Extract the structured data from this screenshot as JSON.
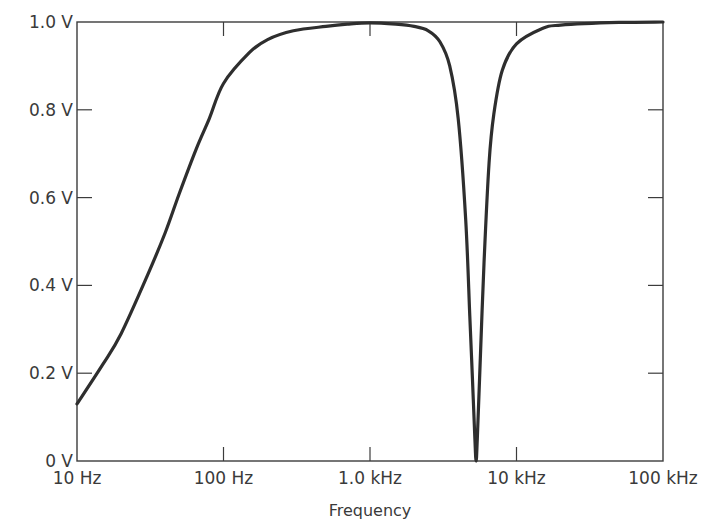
{
  "chart_data": {
    "type": "line",
    "title": "",
    "xlabel": "Frequency",
    "ylabel": "",
    "xscale": "log",
    "xlim_hz": [
      10,
      100000
    ],
    "ylim_v": [
      0,
      1.0
    ],
    "grid": false,
    "legend": null,
    "x_ticks": [
      {
        "value": 10,
        "label": "10 Hz"
      },
      {
        "value": 100,
        "label": "100 Hz"
      },
      {
        "value": 1000,
        "label": "1.0 kHz"
      },
      {
        "value": 10000,
        "label": "10 kHz"
      },
      {
        "value": 100000,
        "label": "100 kHz"
      }
    ],
    "y_ticks": [
      {
        "value": 0,
        "label": "0 V"
      },
      {
        "value": 0.2,
        "label": "0.2 V"
      },
      {
        "value": 0.4,
        "label": "0.4 V"
      },
      {
        "value": 0.6,
        "label": "0.6 V"
      },
      {
        "value": 0.8,
        "label": "0.8 V"
      },
      {
        "value": 1.0,
        "label": "1.0 V"
      }
    ],
    "series": [
      {
        "name": "Output voltage",
        "x_hz": [
          10,
          15,
          20,
          30,
          40,
          50,
          65,
          80,
          100,
          150,
          200,
          300,
          500,
          700,
          1000,
          1500,
          2000,
          2500,
          3000,
          3500,
          4000,
          4500,
          4800,
          5000,
          5200,
          5300,
          5400,
          5600,
          6000,
          6500,
          7000,
          8000,
          10000,
          15000,
          20000,
          50000,
          100000
        ],
        "y_v": [
          0.13,
          0.22,
          0.29,
          0.42,
          0.52,
          0.61,
          0.71,
          0.78,
          0.86,
          0.93,
          0.96,
          0.98,
          0.99,
          0.995,
          0.998,
          0.995,
          0.99,
          0.98,
          0.955,
          0.9,
          0.78,
          0.55,
          0.33,
          0.19,
          0.05,
          0.0,
          0.05,
          0.19,
          0.45,
          0.68,
          0.79,
          0.89,
          0.95,
          0.985,
          0.993,
          0.999,
          1.0
        ]
      }
    ],
    "annotations": [
      {
        "type": "notch",
        "approx_frequency_hz": 5300,
        "min_v": 0.0
      }
    ]
  }
}
